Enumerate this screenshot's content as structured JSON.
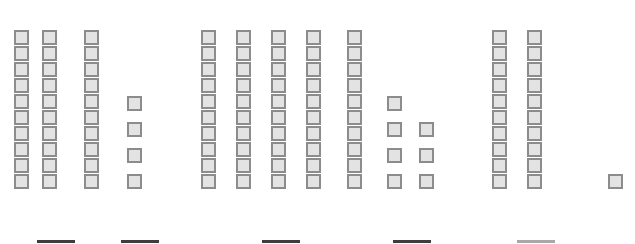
{
  "chart_data": {
    "type": "bar",
    "title": "",
    "subtitle": "",
    "xlabel": "",
    "ylabel": "",
    "grid": false,
    "legend_position": "none",
    "unit_note": "Each bar is drawn as a stack of discrete unit squares; value = number of squares",
    "ylim": [
      0,
      10
    ],
    "categories": [
      "1",
      "2",
      "3",
      "4",
      "5",
      "6",
      "7",
      "8",
      "9",
      "10",
      "11",
      "12",
      "13",
      "14"
    ],
    "values": [
      10,
      10,
      10,
      4,
      10,
      10,
      10,
      10,
      10,
      4,
      3,
      10,
      10,
      1
    ],
    "tick_labels": [
      "",
      "",
      "",
      "",
      "",
      "",
      "",
      "",
      "",
      "",
      "",
      "",
      "",
      ""
    ],
    "annotations": []
  },
  "chart": {
    "square_size": 15,
    "square_step": 16,
    "baseline_y": 189,
    "colors": {
      "square_fill": "#e3e3e3",
      "square_stroke": "#8c8c8c",
      "rule_dark": "#3d3d3d",
      "rule_faint": "#a8a8a8",
      "background": "#ffffff"
    },
    "columns": [
      {
        "name": "column-1",
        "x": 14,
        "count": 10,
        "spacing": "solid"
      },
      {
        "name": "column-2",
        "x": 42,
        "count": 10,
        "spacing": "solid"
      },
      {
        "name": "column-3",
        "x": 84,
        "count": 10,
        "spacing": "solid"
      },
      {
        "name": "column-4",
        "x": 127,
        "count": 4,
        "spacing": "gapped"
      },
      {
        "name": "column-5",
        "x": 201,
        "count": 10,
        "spacing": "solid"
      },
      {
        "name": "column-6",
        "x": 236,
        "count": 10,
        "spacing": "solid"
      },
      {
        "name": "column-7",
        "x": 271,
        "count": 10,
        "spacing": "solid"
      },
      {
        "name": "column-8",
        "x": 306,
        "count": 10,
        "spacing": "solid"
      },
      {
        "name": "column-9",
        "x": 347,
        "count": 10,
        "spacing": "solid"
      },
      {
        "name": "column-10",
        "x": 387,
        "count": 4,
        "spacing": "gapped"
      },
      {
        "name": "column-11",
        "x": 419,
        "count": 3,
        "spacing": "gapped"
      },
      {
        "name": "column-12",
        "x": 492,
        "count": 10,
        "spacing": "solid"
      },
      {
        "name": "column-13",
        "x": 527,
        "count": 10,
        "spacing": "solid"
      },
      {
        "name": "column-14",
        "x": 608,
        "count": 1,
        "spacing": "solid"
      }
    ],
    "label_rules": [
      {
        "name": "label-rule-1",
        "x": 37,
        "width": 38,
        "tone": "dark"
      },
      {
        "name": "label-rule-2",
        "x": 121,
        "width": 38,
        "tone": "dark"
      },
      {
        "name": "label-rule-3",
        "x": 262,
        "width": 38,
        "tone": "dark"
      },
      {
        "name": "label-rule-4",
        "x": 393,
        "width": 38,
        "tone": "dark"
      },
      {
        "name": "label-rule-5",
        "x": 517,
        "width": 38,
        "tone": "faint"
      }
    ]
  }
}
